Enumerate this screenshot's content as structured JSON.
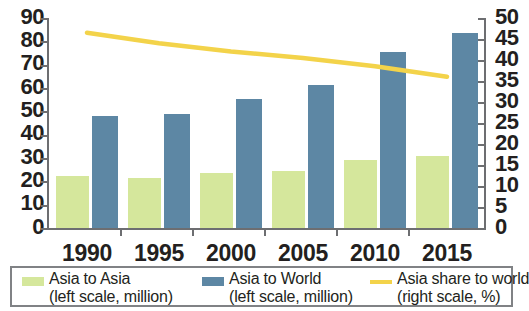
{
  "chart_data": {
    "type": "bar",
    "title": "",
    "subtitle": "",
    "xlabel": "",
    "ylabel": "",
    "categories": [
      "1990",
      "1995",
      "2000",
      "2005",
      "2010",
      "2015"
    ],
    "series": [
      {
        "name": "Asia to Asia",
        "type": "bar",
        "axis": "left",
        "color": "#d5e79c",
        "unit": "million",
        "values": [
          22.5,
          21.5,
          23.5,
          24.5,
          29,
          31
        ]
      },
      {
        "name": "Asia to World",
        "type": "bar",
        "axis": "left",
        "color": "#5d87a4",
        "unit": "million",
        "values": [
          48,
          49,
          55.5,
          61.5,
          75.5,
          83.5
        ]
      },
      {
        "name": "Asia share to world",
        "type": "line",
        "axis": "right",
        "color": "#f3d34a",
        "unit": "%",
        "values": [
          46.5,
          44,
          42,
          40.5,
          38.5,
          36
        ]
      }
    ],
    "left_axis": {
      "min": 0,
      "max": 90,
      "step": 10,
      "ticks": [
        "0",
        "10",
        "20",
        "30",
        "40",
        "50",
        "60",
        "70",
        "80",
        "90"
      ]
    },
    "right_axis": {
      "min": 0,
      "max": 50,
      "step": 5,
      "ticks": [
        "0",
        "5",
        "10",
        "15",
        "20",
        "25",
        "30",
        "35",
        "40",
        "45",
        "50"
      ]
    },
    "grid": false,
    "legend_position": "bottom"
  },
  "legend": {
    "items": [
      {
        "label": "Asia to Asia",
        "scale": "(left scale, million)",
        "swatch": "green-swatch-icon"
      },
      {
        "label": "Asia to World",
        "scale": "(left scale, million)",
        "swatch": "blue-swatch-icon"
      },
      {
        "label": "Asia share to world",
        "scale": "(right scale, %)",
        "swatch": "line-swatch-icon"
      }
    ]
  }
}
